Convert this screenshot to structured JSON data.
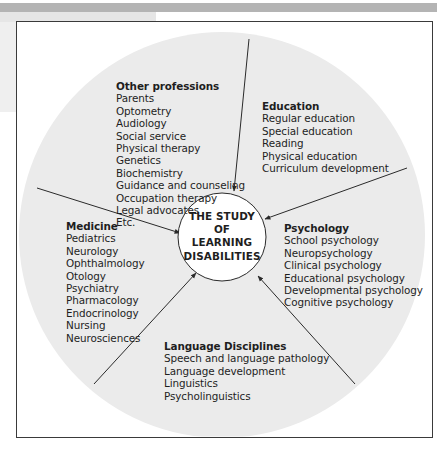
{
  "diagram": {
    "center": {
      "lines": [
        "THE STUDY",
        "OF",
        "LEARNING",
        "DISABILITIES"
      ]
    },
    "groups": {
      "other_professions": {
        "title": "Other professions",
        "items": [
          "Parents",
          "Optometry",
          "Audiology",
          "Social service",
          "Physical therapy",
          "Genetics",
          "Biochemistry",
          "Guidance and counseling",
          "Occupation therapy",
          "Legal advocates",
          "Etc."
        ]
      },
      "education": {
        "title": "Education",
        "items": [
          "Regular education",
          "Special education",
          "Reading",
          "Physical education",
          "Curriculum development"
        ]
      },
      "medicine": {
        "title": "Medicine",
        "items": [
          "Pediatrics",
          "Neurology",
          "Ophthalmology",
          "Otology",
          "Psychiatry",
          "Pharmacology",
          "Endocrinology",
          "Nursing",
          "Neurosciences"
        ]
      },
      "psychology": {
        "title": "Psychology",
        "items": [
          "School psychology",
          "Neuropsychology",
          "Clinical psychology",
          "Educational psychology",
          "Developmental psychology",
          "Cognitive psychology"
        ]
      },
      "language": {
        "title": "Language Disciplines",
        "items": [
          "Speech and language pathology",
          "Language development",
          "Linguistics",
          "Psycholinguistics"
        ]
      }
    },
    "colors": {
      "outer_circle_fill": "#ebebeb",
      "inner_circle_fill": "#ffffff",
      "line": "#2a2a2a",
      "frame": "#3a3a3a",
      "top_bar": "#b4b4b4"
    }
  }
}
